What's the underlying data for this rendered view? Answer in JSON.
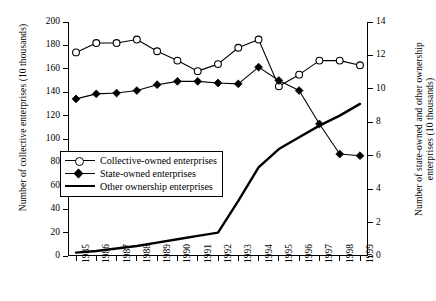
{
  "chart_data": {
    "type": "line",
    "title": "",
    "xlabel": "",
    "categories": [
      "1985",
      "1986",
      "1987",
      "1988",
      "1989",
      "1990",
      "1991",
      "1992",
      "1993",
      "1994",
      "1995",
      "1996",
      "1997",
      "1998",
      "1999"
    ],
    "grid": false,
    "legend_position": "inside-left",
    "axes": {
      "left": {
        "label": "Number of collective enterprises (10 thousands)",
        "ylim": [
          0,
          200
        ],
        "ticks": [
          0,
          20,
          40,
          60,
          80,
          100,
          120,
          140,
          160,
          180,
          200
        ]
      },
      "right": {
        "label": "Number of state-owned and other ownership enterprises (10 thousands)",
        "ylim": [
          0,
          14
        ],
        "ticks": [
          0,
          2,
          4,
          6,
          8,
          10,
          12,
          14
        ]
      }
    },
    "series": [
      {
        "name": "Collective-owned enterprises",
        "axis": "left",
        "marker": "open-circle",
        "values": [
          174,
          182,
          182,
          185,
          175,
          167,
          158,
          164,
          178,
          185,
          145,
          155,
          167,
          167,
          163
        ]
      },
      {
        "name": "State-owned enterprises",
        "axis": "right",
        "marker": "filled-diamond",
        "values": [
          9.4,
          9.7,
          9.75,
          9.9,
          10.25,
          10.45,
          10.45,
          10.35,
          10.3,
          11.3,
          10.5,
          9.9,
          7.9,
          6.1,
          6.0
        ]
      },
      {
        "name": "Other ownership enterprises",
        "axis": "right",
        "marker": "none",
        "values": [
          0.2,
          0.3,
          0.45,
          0.6,
          0.8,
          1.0,
          1.2,
          1.4,
          3.3,
          5.3,
          6.4,
          7.1,
          7.8,
          8.4,
          9.1
        ]
      }
    ]
  },
  "legend": {
    "items": [
      {
        "label": "Collective-owned enterprises"
      },
      {
        "label": "State-owned enterprises"
      },
      {
        "label": "Other ownership enterprises"
      }
    ]
  }
}
